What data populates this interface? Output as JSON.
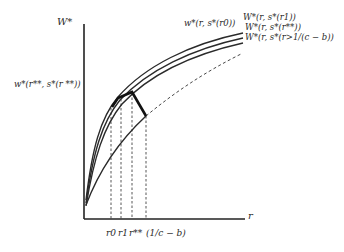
{
  "diagram": {
    "y_axis_label": "W*",
    "x_axis_label": "r",
    "left_label": "w*(r**, s*(r **))",
    "curve_labels": {
      "r0": "w*(r, s*(r0))",
      "r1": "W*(r, s*(r1))",
      "rss": "W*(r, s*(r**))",
      "rgt": "W*(r, s*(r>1/(c − b))"
    },
    "x_ticks": {
      "r0": "r0",
      "r1": "r1",
      "rss": "r**",
      "bound": "(1/c − b)"
    }
  }
}
